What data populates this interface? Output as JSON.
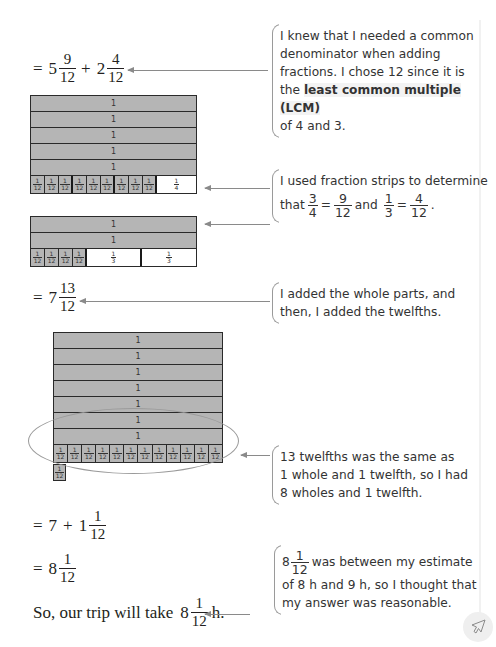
{
  "steps": {
    "step1": {
      "prefix": "=",
      "whole1": "5",
      "num1": "9",
      "den1": "12",
      "op": "+",
      "whole2": "2",
      "num2": "4",
      "den2": "12"
    },
    "step2": {
      "prefix": "=",
      "whole": "7",
      "num": "13",
      "den": "12"
    },
    "step3": {
      "prefix": "=",
      "a": "7",
      "op": "+",
      "whole": "1",
      "num": "1",
      "den": "12"
    },
    "step4": {
      "prefix": "=",
      "whole": "8",
      "num": "1",
      "den": "12"
    },
    "conclusion": {
      "text": "So, our trip will take",
      "whole": "8",
      "num": "1",
      "den": "12",
      "unit": "h."
    }
  },
  "strips": {
    "whole_label": "1",
    "twelfth": {
      "num": "1",
      "den": "12"
    },
    "quarter": {
      "num": "1",
      "den": "4"
    },
    "third": {
      "num": "1",
      "den": "3"
    },
    "group1": {
      "whole_rows": 5,
      "twelfths": 9,
      "blank_part": "1/4"
    },
    "group2": {
      "whole_rows": 2,
      "twelfths": 4,
      "blank_parts": [
        "1/3",
        "1/3"
      ]
    },
    "group3": {
      "whole_rows": 7,
      "twelfths_row": 12,
      "extra_twelfths": 1
    }
  },
  "callouts": {
    "c1": {
      "line1": "I knew that I needed a common",
      "line2": "denominator when adding",
      "line3": "fractions. I chose 12 since it is",
      "line4_pre": "the",
      "line4_bold": "least common multiple (LCM)",
      "line5": "of 4 and 3."
    },
    "c2": {
      "line1": "I used fraction strips to determine",
      "that": "that",
      "f1_num": "3",
      "f1_den": "4",
      "eq1": "=",
      "f2_num": "9",
      "f2_den": "12",
      "and": "and",
      "f3_num": "1",
      "f3_den": "3",
      "eq2": "=",
      "f4_num": "4",
      "f4_den": "12",
      "end": "."
    },
    "c3": {
      "line1": "I added the whole parts, and",
      "line2": "then, I added the twelfths."
    },
    "c4": {
      "line1": "13 twelfths was the same as",
      "line2": "1 whole and 1 twelfth, so I had",
      "line3": "8 wholes and 1 twelfth."
    },
    "c5": {
      "whole": "8",
      "num": "1",
      "den": "12",
      "line1_rest": "was between my estimate",
      "line2": "of 8 h and 9 h, so I thought that",
      "line3": "my answer was reasonable."
    }
  },
  "colors": {
    "strip_fill": "#b5b5b5",
    "strip_border": "#2a2a2a",
    "arrow": "#8a8a8a",
    "text": "#231f20"
  },
  "icons": {
    "corner": "pointer-arrow-icon"
  }
}
